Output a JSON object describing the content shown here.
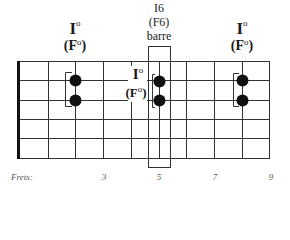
{
  "diagram": {
    "type": "guitar-fretboard",
    "strings": 6,
    "colors": {
      "line": "#333333",
      "dot": "#111111",
      "nut": "#111111"
    }
  },
  "chords": [
    {
      "roman": "I",
      "degree_symbol": "o",
      "name": "(F",
      "name_close": ")",
      "fret": 4,
      "strings": [
        2,
        3
      ]
    },
    {
      "roman": "I6",
      "name": "(F6)",
      "note": "barre",
      "fret": 5,
      "strings": [
        2,
        3
      ]
    },
    {
      "roman": "I",
      "degree_symbol": "o",
      "name": "(F",
      "name_close": ")",
      "fret": 8,
      "strings": [
        2,
        3
      ]
    }
  ],
  "inline_label": {
    "roman": "I",
    "degree_symbol": "o",
    "name": "(F",
    "name_close": ")"
  },
  "frets": {
    "label": "Frets:",
    "numbers": [
      "3",
      "5",
      "7",
      "9"
    ]
  }
}
